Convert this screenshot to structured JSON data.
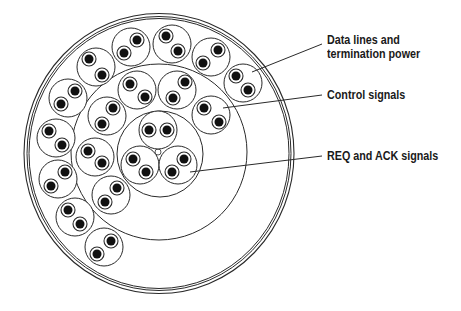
{
  "diagram": {
    "stroke_color": "#2a2a2a",
    "conductor_color": "#111111",
    "background": "#ffffff",
    "outer_jacket": {
      "cx": 159,
      "cy": 153.5,
      "rx": 135,
      "ry": 140,
      "inner_offsets": [
        3,
        5
      ]
    },
    "middle_ring": {
      "cx": 159,
      "cy": 152,
      "r": 88
    },
    "inner_ring": {
      "cx": 160,
      "cy": 154,
      "r": 43
    },
    "center_filler": {
      "cx": 158,
      "cy": 152,
      "r": 3
    },
    "pair_radius": 19,
    "wire_insulation_radius": 7,
    "conductor_radius": 4.5,
    "groups": [
      {
        "name": "REQ and ACK signals",
        "region": "inner",
        "pairs": [
          {
            "cx": 158,
            "cy": 130,
            "wires": [
              [
                149,
                130
              ],
              [
                167,
                130
              ]
            ]
          },
          {
            "cx": 140,
            "cy": 165,
            "wires": [
              [
                133,
                159
              ],
              [
                146,
                172
              ]
            ]
          },
          {
            "cx": 178,
            "cy": 165,
            "wires": [
              [
                184,
                159
              ],
              [
                172,
                172
              ]
            ]
          }
        ]
      },
      {
        "name": "Control signals",
        "region": "middle",
        "pairs": [
          {
            "cx": 137,
            "cy": 90,
            "wires": [
              [
                130,
                84
              ],
              [
                145,
                97
              ]
            ]
          },
          {
            "cx": 177,
            "cy": 90,
            "wires": [
              [
                185,
                82
              ],
              [
                173,
                98
              ]
            ]
          },
          {
            "cx": 211,
            "cy": 115,
            "wires": [
              [
                204,
                108
              ],
              [
                219,
                122
              ]
            ]
          },
          {
            "cx": 107,
            "cy": 116,
            "wires": [
              [
                113,
                108
              ],
              [
                102,
                124
              ]
            ]
          },
          {
            "cx": 95,
            "cy": 157,
            "wires": [
              [
                88,
                151
              ],
              [
                102,
                163
              ]
            ]
          },
          {
            "cx": 111,
            "cy": 195,
            "wires": [
              [
                117,
                188
              ],
              [
                105,
                202
              ]
            ]
          }
        ]
      },
      {
        "name": "Data lines and termination power",
        "region": "outer",
        "pairs": [
          {
            "cx": 131,
            "cy": 47,
            "wires": [
              [
                137,
                40
              ],
              [
                124,
                53
              ]
            ]
          },
          {
            "cx": 172,
            "cy": 44,
            "wires": [
              [
                166,
                36
              ],
              [
                178,
                51
              ]
            ]
          },
          {
            "cx": 211,
            "cy": 57,
            "wires": [
              [
                218,
                50
              ],
              [
                203,
                63
              ]
            ]
          },
          {
            "cx": 243,
            "cy": 83,
            "wires": [
              [
                236,
                76
              ],
              [
                248,
                90
              ]
            ]
          },
          {
            "cx": 96,
            "cy": 67,
            "wires": [
              [
                89,
                59
              ],
              [
                102,
                75
              ]
            ]
          },
          {
            "cx": 68,
            "cy": 98,
            "wires": [
              [
                75,
                91
              ],
              [
                61,
                104
              ]
            ]
          },
          {
            "cx": 56,
            "cy": 138,
            "wires": [
              [
                49,
                131
              ],
              [
                62,
                145
              ]
            ]
          },
          {
            "cx": 58,
            "cy": 179,
            "wires": [
              [
                65,
                172
              ],
              [
                51,
                186
              ]
            ]
          },
          {
            "cx": 75,
            "cy": 217,
            "wires": [
              [
                68,
                210
              ],
              [
                80,
                224
              ]
            ]
          },
          {
            "cx": 104,
            "cy": 247,
            "wires": [
              [
                111,
                241
              ],
              [
                97,
                254
              ]
            ]
          }
        ]
      }
    ],
    "callouts": [
      {
        "lines": [
          "Data lines and",
          "termination power"
        ],
        "from": [
          252,
          72
        ],
        "to": [
          322,
          44
        ],
        "label_x": 327,
        "label_y": 33
      },
      {
        "lines": [
          "Control signals"
        ],
        "from": [
          223,
          108
        ],
        "to": [
          322,
          95
        ],
        "label_x": 327,
        "label_y": 88
      },
      {
        "lines": [
          "REQ and ACK signals"
        ],
        "from": [
          190,
          172
        ],
        "to": [
          322,
          156
        ],
        "label_x": 327,
        "label_y": 149
      }
    ]
  }
}
